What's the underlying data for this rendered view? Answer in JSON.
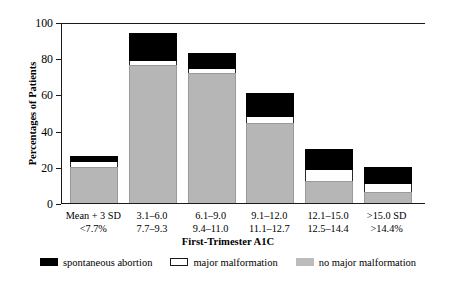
{
  "chart_data": {
    "type": "bar",
    "title": "",
    "xlabel": "First-Trimester A1C",
    "ylabel": "Percentages of Patients",
    "ylim": [
      0,
      100
    ],
    "yticks": [
      0,
      20,
      40,
      60,
      80,
      100
    ],
    "grid": false,
    "stacked": true,
    "legend_position": "bottom",
    "categories": [
      "Mean + 3 SD\n<7.7%",
      "3.1–6.0\n7.7–9.3",
      "6.1–9.0\n9.4–11.0",
      "9.1–12.0\n11.1–12.7",
      "12.1–15.0\n12.5–14.4",
      ">15.0 SD\n>14.4%"
    ],
    "category_lines": [
      [
        "Mean + 3 SD",
        "<7.7%"
      ],
      [
        "3.1–6.0",
        "7.7–9.3"
      ],
      [
        "6.1–9.0",
        "9.4–11.0"
      ],
      [
        "9.1–12.0",
        "11.1–12.7"
      ],
      [
        "12.1–15.0",
        "12.5–14.4"
      ],
      [
        ">15.0 SD",
        ">14.4%"
      ]
    ],
    "series": [
      {
        "name": "no major malformation",
        "color": "#b6b6b6",
        "values": [
          20,
          76,
          72,
          44,
          12,
          6
        ]
      },
      {
        "name": "major malformation",
        "color": "#ffffff",
        "values": [
          2.5,
          2.5,
          2,
          3.5,
          6,
          4.5
        ]
      },
      {
        "name": "spontaneous abortion",
        "color": "#000000",
        "values": [
          3.5,
          15.5,
          9,
          13.5,
          12,
          9.5
        ]
      }
    ],
    "cumulative_tops": [
      [
        20,
        22.5,
        26
      ],
      [
        76,
        78.5,
        94
      ],
      [
        72,
        74,
        83
      ],
      [
        44,
        47.5,
        61
      ],
      [
        12,
        18,
        30
      ],
      [
        6,
        10.5,
        20
      ]
    ]
  },
  "legend": {
    "items": [
      {
        "label": "spontaneous abortion",
        "swatch": "black-swatch-icon"
      },
      {
        "label": "major malformation",
        "swatch": "white-swatch-icon"
      },
      {
        "label": "no major malformation",
        "swatch": "gray-swatch-icon"
      }
    ]
  }
}
